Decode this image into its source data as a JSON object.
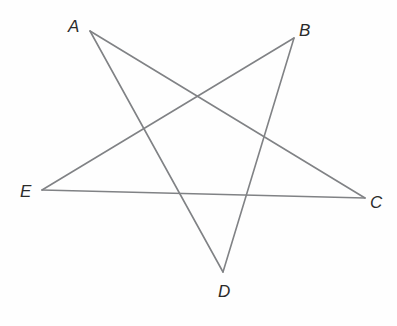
{
  "figure": {
    "name": "five-pointed-star-pentagram",
    "type": "geometry-diagram",
    "background_color": "#fefefe",
    "stroke_color": "#808285",
    "stroke_width": 1.6,
    "label_color": "#2b2b2b",
    "width": 397,
    "height": 326
  },
  "vertices": [
    {
      "id": "A",
      "label": "A",
      "x": 90,
      "y": 31,
      "label_x": 68,
      "label_y": 18
    },
    {
      "id": "B",
      "label": "B",
      "x": 294,
      "y": 38,
      "label_x": 299,
      "label_y": 22
    },
    {
      "id": "C",
      "label": "C",
      "x": 365,
      "y": 198,
      "label_x": 370,
      "label_y": 194
    },
    {
      "id": "D",
      "label": "D",
      "x": 223,
      "y": 272,
      "label_x": 218,
      "label_y": 283
    },
    {
      "id": "E",
      "label": "E",
      "x": 42,
      "y": 190,
      "label_x": 20,
      "label_y": 183
    }
  ],
  "edges": [
    {
      "name": "segment-A-C",
      "from": "A",
      "to": "C",
      "x1": 90,
      "y1": 31,
      "x2": 365,
      "y2": 198
    },
    {
      "name": "segment-C-E",
      "from": "C",
      "to": "E",
      "x1": 365,
      "y1": 198,
      "x2": 42,
      "y2": 190
    },
    {
      "name": "segment-E-B",
      "from": "E",
      "to": "B",
      "x1": 42,
      "y1": 190,
      "x2": 294,
      "y2": 38
    },
    {
      "name": "segment-B-D",
      "from": "B",
      "to": "D",
      "x1": 294,
      "y1": 38,
      "x2": 223,
      "y2": 272
    },
    {
      "name": "segment-D-A",
      "from": "D",
      "to": "A",
      "x1": 223,
      "y1": 272,
      "x2": 90,
      "y2": 31
    }
  ],
  "chart_data": {
    "type": "scatter",
    "title": "",
    "xlabel": "",
    "ylabel": "",
    "categories": [
      "A",
      "B",
      "C",
      "D",
      "E"
    ],
    "x": [
      90,
      294,
      365,
      223,
      42
    ],
    "y": [
      31,
      38,
      198,
      272,
      190
    ],
    "path_order": [
      "A",
      "C",
      "E",
      "B",
      "D",
      "A"
    ],
    "grid": false,
    "legend": "none"
  }
}
